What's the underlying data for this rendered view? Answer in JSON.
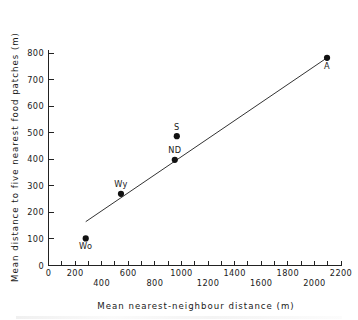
{
  "chart_data": {
    "type": "scatter",
    "title": "",
    "xlabel": "Mean nearest-neighbour distance (m)",
    "ylabel": "Mean distance to five nearest food patches (m)",
    "xlim": [
      0,
      2200
    ],
    "ylim": [
      0,
      800
    ],
    "grid": false,
    "legend": "none",
    "x_ticks": [
      0,
      100,
      200,
      300,
      400,
      500,
      600,
      700,
      800,
      900,
      1000,
      1100,
      1200,
      1300,
      1400,
      1500,
      1600,
      1700,
      1800,
      1900,
      2000,
      2100,
      2200
    ],
    "x_tick_labels_upper": [
      {
        "value": 0,
        "label": "0"
      },
      {
        "value": 200,
        "label": "200"
      },
      {
        "value": 600,
        "label": "600"
      },
      {
        "value": 1000,
        "label": "1000"
      },
      {
        "value": 1400,
        "label": "1400"
      },
      {
        "value": 1800,
        "label": "1800"
      },
      {
        "value": 2200,
        "label": "2200"
      }
    ],
    "x_tick_labels_lower": [
      {
        "value": 400,
        "label": "400"
      },
      {
        "value": 800,
        "label": "800"
      },
      {
        "value": 1200,
        "label": "1200"
      },
      {
        "value": 1600,
        "label": "1600"
      },
      {
        "value": 2000,
        "label": "2000"
      }
    ],
    "y_ticks": [
      100,
      200,
      300,
      400,
      500,
      600,
      700,
      800
    ],
    "y_tick_labels": [
      "100",
      "200",
      "300",
      "400",
      "500",
      "600",
      "700",
      "800"
    ],
    "y_origin_label": "0",
    "points": [
      {
        "label": "Wo",
        "x": 280,
        "y": 102,
        "label_pos": "below"
      },
      {
        "label": "Wy",
        "x": 545,
        "y": 270,
        "label_pos": "above"
      },
      {
        "label": "ND",
        "x": 950,
        "y": 398,
        "label_pos": "above"
      },
      {
        "label": "S",
        "x": 965,
        "y": 487,
        "label_pos": "above"
      },
      {
        "label": "A",
        "x": 2095,
        "y": 782,
        "label_pos": "below"
      }
    ],
    "fit_line": {
      "x_start": 280,
      "y_start": 165,
      "x_end": 2095,
      "y_end": 782
    }
  },
  "colors": {
    "marker": "#111111",
    "axis": "#222222",
    "line": "#333333",
    "background": "#ffffff"
  }
}
